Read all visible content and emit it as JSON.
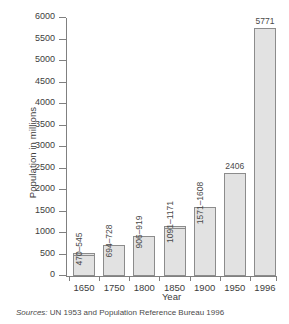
{
  "chart_data": {
    "type": "bar",
    "title": "",
    "xlabel": "Year",
    "ylabel": "Population in millions",
    "categories": [
      "1650",
      "1750",
      "1800",
      "1850",
      "1900",
      "1950",
      "1996"
    ],
    "values": [
      545,
      728,
      919,
      1171,
      1608,
      2406,
      5771
    ],
    "value_low": [
      470,
      694,
      906,
      1091,
      1571,
      null,
      null
    ],
    "value_high": [
      545,
      728,
      919,
      1171,
      1608,
      2406,
      5771
    ],
    "data_labels": [
      "470–545",
      "694–728",
      "906–919",
      "1091–1171",
      "1571–1608",
      "2406",
      "5771"
    ],
    "label_orientation": [
      "vertical",
      "vertical",
      "vertical",
      "vertical",
      "vertical",
      "horizontal",
      "horizontal"
    ],
    "ylim": [
      0,
      6000
    ],
    "yticks": [
      "0",
      "500",
      "1000",
      "1500",
      "2000",
      "2500",
      "3000",
      "3500",
      "4000",
      "4500",
      "5000",
      "5500",
      "6000"
    ],
    "ytick_values": [
      0,
      500,
      1000,
      1500,
      2000,
      2500,
      3000,
      3500,
      4000,
      4500,
      5000,
      5500,
      6000
    ],
    "grid": false,
    "legend": null,
    "bar_color": "#e2e2e2",
    "bar_border_color": "#8c8c8c",
    "axis_color": "#808080",
    "text_color": "#3d3d3d",
    "background": "#ffffff",
    "annotations": {
      "source_label": "Sources:",
      "source_text": "UN 1953 and Population Reference Bureau 1996"
    }
  }
}
